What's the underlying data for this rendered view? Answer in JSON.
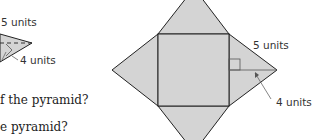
{
  "figure": {
    "type": "square pyramid and its net",
    "colors": {
      "face_fill": "#d4d4d4",
      "edge_stroke": "#222222",
      "annotation_stroke": "#666666",
      "text": "#333333"
    },
    "left_pyramid": {
      "slant_height_label": "5 units",
      "base_label": "4 units"
    },
    "net": {
      "slant_height_label": "5 units",
      "base_half_label": "4 units"
    }
  },
  "questions": [
    {
      "text": "f the pyramid?"
    },
    {
      "text": "e pyramid?"
    }
  ]
}
